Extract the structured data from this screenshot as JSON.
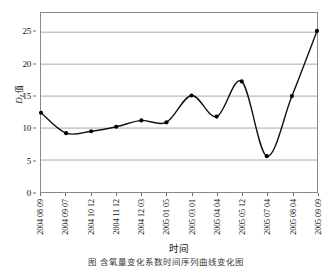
{
  "chart_data": {
    "type": "line",
    "title": "",
    "xlabel": "时间",
    "ylabel": "D_L值",
    "ylabel_parts": {
      "symbol": "D",
      "subscript": "L",
      "suffix": "值"
    },
    "categories": [
      "2004 08 09",
      "2004 09 07",
      "2004 10 12",
      "2004 11 12",
      "2004 12 03",
      "2005 01 05",
      "2005 03 01",
      "2005 04 04",
      "2005 05 12",
      "2005 07 04",
      "2005 08 04",
      "2005 09 09"
    ],
    "values": [
      12.4,
      9.2,
      9.5,
      10.2,
      11.2,
      10.9,
      15.1,
      11.8,
      17.3,
      5.6,
      15.0,
      25.2
    ],
    "ylim": [
      0,
      28
    ],
    "yticks": [
      0,
      5,
      10,
      15,
      20,
      25
    ],
    "ytick_labels": [
      "0",
      "5",
      "10",
      "15",
      "20",
      "25"
    ],
    "grid": "horizontal",
    "legend": "none",
    "marker": "filled-circle",
    "line_color": "#111111",
    "marker_color": "#000000",
    "grid_color": "#a9a9a9",
    "frame_color": "#8a8a8a",
    "smoothing": "spline"
  },
  "caption": {
    "text": "图    含氧量变化系数时间序列曲线变化图"
  }
}
